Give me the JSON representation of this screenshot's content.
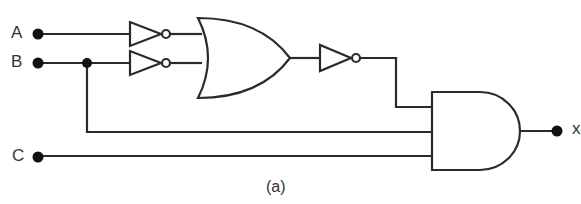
{
  "diagram": {
    "type": "logic-circuit",
    "inputs": [
      {
        "label": "A"
      },
      {
        "label": "B"
      },
      {
        "label": "C"
      }
    ],
    "output": {
      "label": "x"
    },
    "caption": "(a)",
    "gates": [
      {
        "id": "not1",
        "type": "NOT",
        "in": [
          "A"
        ]
      },
      {
        "id": "not2",
        "type": "NOT",
        "in": [
          "B"
        ]
      },
      {
        "id": "or1",
        "type": "OR",
        "in": [
          "not1",
          "not2"
        ]
      },
      {
        "id": "not3",
        "type": "NOT",
        "in": [
          "or1"
        ]
      },
      {
        "id": "and1",
        "type": "AND",
        "in": [
          "not3",
          "B",
          "C"
        ]
      }
    ],
    "line_color": "#2a2a2a"
  }
}
